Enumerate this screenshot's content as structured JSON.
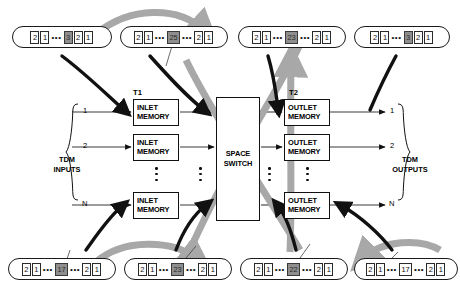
{
  "diagram": {
    "stage1_label": "T1",
    "stage2_label": "T2",
    "space_switch_line1": "SPACE",
    "space_switch_line2": "SWITCH",
    "inlet_memory_line1": "INLET",
    "inlet_memory_line2": "MEMORY",
    "outlet_memory_line1": "OUTLET",
    "outlet_memory_line2": "MEMORY",
    "inputs_label_line1": "TDM",
    "inputs_label_line2": "INPUTS",
    "outputs_label_line1": "TDM",
    "outputs_label_line2": "OUTPUTS",
    "port_labels": [
      "1",
      "2",
      "N"
    ],
    "ellipsis": "•••",
    "colors": {
      "line": "#111111",
      "highlight_cell": "#8e8e8e",
      "gray_arrow": "#a8a8a8",
      "black_arrow": "#111111"
    }
  },
  "top_frames": [
    {
      "name": "top-frame-1",
      "cells": [
        {
          "text": "2",
          "shaded": false
        },
        {
          "text": "1",
          "shaded": false
        },
        {
          "text": "•••",
          "gap": true
        },
        {
          "text": "3",
          "shaded": true
        },
        {
          "text": "2",
          "shaded": false
        },
        {
          "text": "1",
          "shaded": false
        }
      ]
    },
    {
      "name": "top-frame-2",
      "cells": [
        {
          "text": "2",
          "shaded": false
        },
        {
          "text": "1",
          "shaded": false
        },
        {
          "text": "•••",
          "gap": true
        },
        {
          "text": "25",
          "shaded": true,
          "wide": true
        },
        {
          "text": "•••",
          "gap": true
        },
        {
          "text": "2",
          "shaded": false
        },
        {
          "text": "1",
          "shaded": false
        }
      ]
    },
    {
      "name": "top-frame-3",
      "cells": [
        {
          "text": "2",
          "shaded": false
        },
        {
          "text": "1",
          "shaded": false
        },
        {
          "text": "•••",
          "gap": true
        },
        {
          "text": "23",
          "shaded": true,
          "wide": true
        },
        {
          "text": "•••",
          "gap": true
        },
        {
          "text": "2",
          "shaded": false
        },
        {
          "text": "1",
          "shaded": false
        }
      ]
    },
    {
      "name": "top-frame-4",
      "cells": [
        {
          "text": "2",
          "shaded": false
        },
        {
          "text": "1",
          "shaded": false
        },
        {
          "text": "•••",
          "gap": true
        },
        {
          "text": "3",
          "shaded": true
        },
        {
          "text": "2",
          "shaded": false
        },
        {
          "text": "1",
          "shaded": false
        }
      ]
    }
  ],
  "bottom_frames": [
    {
      "name": "bottom-frame-1",
      "cells": [
        {
          "text": "2",
          "shaded": false
        },
        {
          "text": "1",
          "shaded": false
        },
        {
          "text": "•••",
          "gap": true
        },
        {
          "text": "17",
          "shaded": true,
          "wide": true
        },
        {
          "text": "•••",
          "gap": true
        },
        {
          "text": "2",
          "shaded": false
        },
        {
          "text": "1",
          "shaded": false
        }
      ]
    },
    {
      "name": "bottom-frame-2",
      "cells": [
        {
          "text": "2",
          "shaded": false
        },
        {
          "text": "1",
          "shaded": false
        },
        {
          "text": "•••",
          "gap": true
        },
        {
          "text": "23",
          "shaded": true,
          "wide": true
        },
        {
          "text": "•••",
          "gap": true
        },
        {
          "text": "2",
          "shaded": false
        },
        {
          "text": "1",
          "shaded": false
        }
      ]
    },
    {
      "name": "bottom-frame-3",
      "cells": [
        {
          "text": "2",
          "shaded": false
        },
        {
          "text": "1",
          "shaded": false
        },
        {
          "text": "•••",
          "gap": true
        },
        {
          "text": "22",
          "shaded": true,
          "wide": true
        },
        {
          "text": "•••",
          "gap": true
        },
        {
          "text": "2",
          "shaded": false
        },
        {
          "text": "1",
          "shaded": false
        }
      ]
    },
    {
      "name": "bottom-frame-4",
      "cells": [
        {
          "text": "2",
          "shaded": false
        },
        {
          "text": "1",
          "shaded": false
        },
        {
          "text": "•••",
          "gap": true
        },
        {
          "text": "17",
          "shaded": false,
          "wide": true
        },
        {
          "text": "•••",
          "gap": true
        },
        {
          "text": "2",
          "shaded": false
        },
        {
          "text": "1",
          "shaded": false
        }
      ]
    }
  ]
}
